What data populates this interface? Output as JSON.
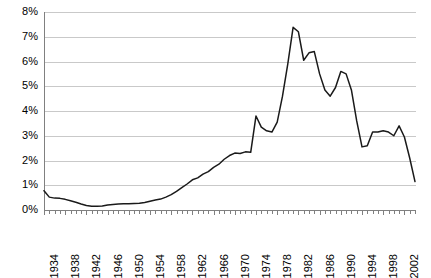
{
  "chart_data": {
    "type": "line",
    "title": "",
    "subtitle": "",
    "xlabel": "",
    "ylabel": "",
    "xlim": [
      1934,
      2004
    ],
    "ylim": [
      0,
      8
    ],
    "ytick_labels": [
      "0%",
      "1%",
      "2%",
      "3%",
      "4%",
      "5%",
      "6%",
      "7%",
      "8%"
    ],
    "ytick_values": [
      0,
      1,
      2,
      3,
      4,
      5,
      6,
      7,
      8
    ],
    "xtick_labels": [
      "1934",
      "1938",
      "1942",
      "1946",
      "1950",
      "1954",
      "1958",
      "1962",
      "1966",
      "1970",
      "1974",
      "1978",
      "1982",
      "1986",
      "1990",
      "1994",
      "1998",
      "2002"
    ],
    "xtick_values": [
      1934,
      1938,
      1942,
      1946,
      1950,
      1954,
      1958,
      1962,
      1966,
      1970,
      1974,
      1978,
      1982,
      1986,
      1990,
      1994,
      1998,
      2002
    ],
    "xtick_minor_step": 1,
    "grid": "horizontal",
    "legend": "none",
    "line_color": "#1a1a1a",
    "grid_color": "#c9c9c9",
    "axis_color": "#808080",
    "background_color": "#ffffff",
    "units": "percent",
    "x": [
      1934,
      1935,
      1936,
      1937,
      1938,
      1939,
      1940,
      1941,
      1942,
      1943,
      1944,
      1945,
      1946,
      1947,
      1948,
      1949,
      1950,
      1951,
      1952,
      1953,
      1954,
      1955,
      1956,
      1957,
      1958,
      1959,
      1960,
      1961,
      1962,
      1963,
      1964,
      1965,
      1966,
      1967,
      1968,
      1969,
      1970,
      1971,
      1972,
      1973,
      1974,
      1975,
      1976,
      1977,
      1978,
      1979,
      1980,
      1981,
      1982,
      1983,
      1984,
      1985,
      1986,
      1987,
      1988,
      1989,
      1990,
      1991,
      1992,
      1993,
      1994,
      1995,
      1996,
      1997,
      1998,
      1999,
      2000,
      2001,
      2002,
      2003,
      2004
    ],
    "values": [
      0.78,
      0.52,
      0.48,
      0.47,
      0.43,
      0.37,
      0.31,
      0.24,
      0.18,
      0.15,
      0.15,
      0.16,
      0.2,
      0.22,
      0.24,
      0.25,
      0.25,
      0.26,
      0.27,
      0.3,
      0.35,
      0.4,
      0.44,
      0.52,
      0.62,
      0.75,
      0.9,
      1.05,
      1.22,
      1.3,
      1.45,
      1.55,
      1.72,
      1.85,
      2.05,
      2.2,
      2.3,
      2.28,
      2.35,
      2.33,
      3.8,
      3.35,
      3.2,
      3.15,
      3.55,
      4.6,
      5.9,
      7.38,
      7.2,
      6.05,
      6.35,
      6.4,
      5.5,
      4.85,
      4.6,
      4.95,
      5.6,
      5.5,
      4.85,
      3.6,
      2.55,
      2.6,
      3.15,
      3.15,
      3.2,
      3.15,
      3.0,
      3.4,
      2.95,
      2.1,
      1.15
    ],
    "series_name": "Annual percentage",
    "notes": [
      {
        "label": "minimum",
        "x": 1943,
        "y": 0.15
      },
      {
        "label": "peak",
        "x": 1981,
        "y": 7.38
      },
      {
        "label": "secondary-peak",
        "x": 1990,
        "y": 5.6
      },
      {
        "label": "final",
        "x": 2004,
        "y": 1.15
      }
    ]
  }
}
